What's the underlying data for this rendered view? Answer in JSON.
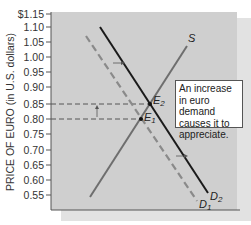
{
  "chart_data": {
    "type": "line",
    "title": "",
    "xlabel": "",
    "ylabel": "PRICE OF EURO (in U.S. dollars)",
    "y_ticks": [
      "$1.15",
      "1.10",
      "1.05",
      "1.00",
      "0.95",
      "0.90",
      "0.85",
      "0.80",
      "0.75",
      "0.70",
      "0.65",
      "0.60",
      "0.55"
    ],
    "ylim": [
      0.5,
      1.15
    ],
    "grid": false,
    "legend": "none",
    "series": [
      {
        "name": "S",
        "style": "solid gray",
        "points": [
          {
            "y": 0.54
          },
          {
            "y": 1.0
          }
        ]
      },
      {
        "name": "D1",
        "style": "dashed gray",
        "points": [
          {
            "y": 1.07
          },
          {
            "y": 0.52
          }
        ]
      },
      {
        "name": "D2",
        "style": "solid black",
        "points": [
          {
            "y": 1.1
          },
          {
            "y": 0.55
          }
        ]
      }
    ],
    "equilibria": [
      {
        "label": "E1",
        "price": 0.8
      },
      {
        "label": "E2",
        "price": 0.85
      }
    ],
    "annotations": [
      "An increase in euro demand causes it to appreciate.",
      "shift arrows from D1 to D2",
      "upward arrow from 0.80 to 0.85"
    ]
  },
  "labels": {
    "ylabel": "PRICE OF EURO (in U.S. dollars)",
    "supply": "S",
    "demand1": "D",
    "demand1_sub": "1",
    "demand2": "D",
    "demand2_sub": "2",
    "eq1": "E",
    "eq1_sub": "1",
    "eq2": "E",
    "eq2_sub": "2",
    "note": "An increase in euro demand causes it to appreciate."
  },
  "ticks": [
    {
      "label": "$1.15",
      "y": 14
    },
    {
      "label": "1.10",
      "y": 27
    },
    {
      "label": "1.05",
      "y": 42
    },
    {
      "label": "1.00",
      "y": 57
    },
    {
      "label": "0.95",
      "y": 72
    },
    {
      "label": "0.90",
      "y": 87
    },
    {
      "label": "0.85",
      "y": 104
    },
    {
      "label": "0.80",
      "y": 119
    },
    {
      "label": "0.75",
      "y": 134
    },
    {
      "label": "0.70",
      "y": 150
    },
    {
      "label": "0.65",
      "y": 165
    },
    {
      "label": "0.60",
      "y": 180
    },
    {
      "label": "0.55",
      "y": 195
    }
  ],
  "colors": {
    "plot_bg": "#cfcfcf",
    "shadow_bg": "#dedede",
    "axis": "#555555",
    "supply": "#6e6e6e",
    "d1": "#8a8a8a",
    "d2": "#1a1a1a",
    "dashed_guide": "#555555"
  }
}
